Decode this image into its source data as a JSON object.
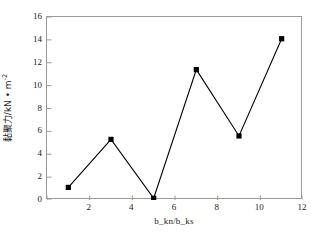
{
  "chart_data": {
    "type": "line",
    "title": "",
    "xlabel": "b_kn/b_ks",
    "ylabel_cjk": "黏聚力",
    "ylabel_unit": "/kN • m",
    "ylabel_exp": "-2",
    "ylabel_full": "黏聚力/kN • m-2",
    "x": [
      1,
      3,
      5,
      7,
      9,
      11
    ],
    "values": [
      1.1,
      5.3,
      0.15,
      11.4,
      5.6,
      14.1
    ],
    "series": [
      {
        "name": "cohesion",
        "x": [
          1,
          3,
          5,
          7,
          9,
          11
        ],
        "values": [
          1.1,
          5.3,
          0.15,
          11.4,
          5.6,
          14.1
        ],
        "marker": "square",
        "marker_color": "#000000",
        "line_color": "#000000"
      }
    ],
    "xlim": [
      0,
      12
    ],
    "ylim": [
      0,
      16
    ],
    "xticks": [
      0,
      2,
      4,
      6,
      8,
      10,
      12
    ],
    "xtick_labels": [
      "",
      "2",
      "4",
      "6",
      "8",
      "10",
      "12"
    ],
    "yticks": [
      0,
      2,
      4,
      6,
      8,
      10,
      12,
      14,
      16
    ],
    "ytick_labels": [
      "0",
      "2",
      "4",
      "6",
      "8",
      "10",
      "12",
      "14",
      "16"
    ],
    "grid": false,
    "legend": null,
    "frame_color": "#9a9a9a",
    "background": "#ffffff"
  }
}
